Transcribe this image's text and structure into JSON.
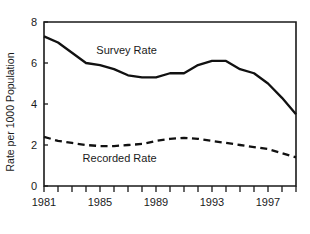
{
  "chart_data": {
    "type": "line",
    "title": "",
    "xlabel": "",
    "ylabel": "Rate per 1000 Population",
    "xlim": [
      1981,
      1999
    ],
    "ylim": [
      0,
      8
    ],
    "grid": false,
    "legend_position": "inline-annotation",
    "x": [
      1981,
      1982,
      1983,
      1984,
      1985,
      1986,
      1987,
      1988,
      1989,
      1990,
      1991,
      1992,
      1993,
      1994,
      1995,
      1996,
      1997,
      1998,
      1999
    ],
    "x_tick_values": [
      1981,
      1982,
      1983,
      1984,
      1985,
      1986,
      1987,
      1988,
      1989,
      1990,
      1991,
      1992,
      1993,
      1994,
      1995,
      1996,
      1997,
      1998,
      1999
    ],
    "x_tick_labels": [
      "1981",
      "",
      "",
      "",
      "1985",
      "",
      "",
      "",
      "1989",
      "",
      "",
      "",
      "1993",
      "",
      "",
      "",
      "1997",
      "",
      ""
    ],
    "x_labeled_ticks": [
      "1981",
      "1985",
      "1989",
      "1993",
      "1997"
    ],
    "y_ticks": [
      0,
      2,
      4,
      6,
      8
    ],
    "y_tick_labels": [
      "0",
      "2",
      "4",
      "6",
      "8"
    ],
    "series": [
      {
        "name": "Survey Rate",
        "style": "solid",
        "label_text": "Survey Rate",
        "values": [
          7.3,
          7.0,
          6.5,
          6.0,
          5.9,
          5.7,
          5.4,
          5.3,
          5.3,
          5.5,
          5.5,
          5.9,
          6.1,
          6.1,
          5.7,
          5.5,
          5.0,
          4.3,
          3.5
        ]
      },
      {
        "name": "Recorded Rate",
        "style": "dashed",
        "label_text": "Recorded Rate",
        "values": [
          2.4,
          2.2,
          2.1,
          2.0,
          1.95,
          1.95,
          2.0,
          2.05,
          2.2,
          2.3,
          2.35,
          2.3,
          2.2,
          2.1,
          2.0,
          1.9,
          1.8,
          1.6,
          1.4
        ]
      }
    ],
    "annotations": [
      {
        "text": "Survey Rate",
        "x": 1986.9,
        "y": 6.45
      },
      {
        "text": "Recorded Rate",
        "x": 1986.4,
        "y": 1.15
      }
    ]
  }
}
